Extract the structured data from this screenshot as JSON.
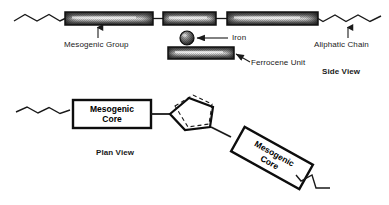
{
  "figure": {
    "title_side": "Side View",
    "title_plan": "Plan View"
  },
  "side_view": {
    "labels": {
      "mesogenic_group": "Mesogenic Group",
      "iron": "Iron",
      "ferrocene_unit": "Ferrocene Unit",
      "aliphatic_chain": "Aliphatic Chain"
    },
    "bars": [
      {
        "name": "mesogenic-bar-left",
        "x": 65,
        "y": 12,
        "w": 88,
        "h": 13
      },
      {
        "name": "mesogenic-bar-middle",
        "x": 163,
        "y": 12,
        "w": 53,
        "h": 13
      },
      {
        "name": "mesogenic-bar-right",
        "x": 227,
        "y": 12,
        "w": 91,
        "h": 13
      },
      {
        "name": "ferrocene-bar",
        "x": 168,
        "y": 47,
        "w": 66,
        "h": 12
      }
    ],
    "iron_atom": {
      "cx": 187,
      "cy": 38,
      "r": 7
    }
  },
  "plan_view": {
    "box_left_label": "Mesogenic\nCore",
    "box_right_label": "Mesogenic\nCore"
  },
  "colors": {
    "stroke": "#1a1a1a",
    "bar_dark": "#272727",
    "bar_mid": "#8a8a8a",
    "bar_light": "#f2f2f2",
    "background": "#ffffff"
  }
}
